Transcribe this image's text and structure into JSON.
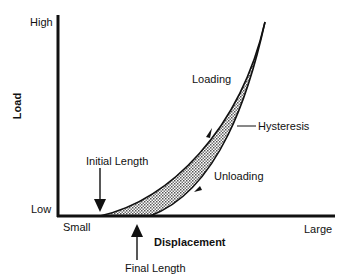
{
  "diagram": {
    "y_axis": {
      "title": "Load",
      "high_label": "High",
      "low_label": "Low"
    },
    "x_axis": {
      "title": "Displacement",
      "small_label": "Small",
      "large_label": "Large"
    },
    "curves": {
      "loading_label": "Loading",
      "unloading_label": "Unloading",
      "hysteresis_label": "Hysteresis"
    },
    "annotations": {
      "initial_length": "Initial Length",
      "final_length": "Final Length"
    },
    "colors": {
      "line": "#111111",
      "fill": "#b8b8b8",
      "background": "#ffffff"
    }
  }
}
